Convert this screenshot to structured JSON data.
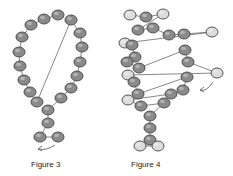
{
  "figures": [
    {
      "id": "figure-3",
      "caption": "Figure 3",
      "bead_color_dark": "#8a8a8a",
      "bead_color_light": "#c9c9c9",
      "stroke": "#444444",
      "beads": [
        [
          58,
          15,
          "d"
        ],
        [
          44,
          19,
          "d"
        ],
        [
          31,
          25,
          "d"
        ],
        [
          22,
          37,
          "d"
        ],
        [
          19,
          52,
          "d"
        ],
        [
          20,
          66,
          "d"
        ],
        [
          24,
          80,
          "d"
        ],
        [
          30,
          92,
          "d"
        ],
        [
          37,
          102,
          "d"
        ],
        [
          71,
          20,
          "d"
        ],
        [
          80,
          33,
          "d"
        ],
        [
          82,
          47,
          "d"
        ],
        [
          80,
          62,
          "d"
        ],
        [
          77,
          76,
          "d"
        ],
        [
          71,
          88,
          "d"
        ],
        [
          61,
          98,
          "d"
        ],
        [
          48,
          110,
          "d"
        ],
        [
          48,
          123,
          "d"
        ],
        [
          40,
          137,
          "d"
        ],
        [
          58,
          137,
          "d"
        ]
      ],
      "arrow": {
        "from": [
          55,
          145
        ],
        "to": [
          38,
          149
        ]
      }
    },
    {
      "id": "figure-4",
      "caption": "Figure 4",
      "bead_color_dark": "#8a8a8a",
      "bead_color_light": "#dcdcdc",
      "stroke": "#444444",
      "beads": [
        [
          20,
          15,
          "l"
        ],
        [
          36,
          17,
          "d"
        ],
        [
          53,
          14,
          "l"
        ],
        [
          28,
          30,
          "d"
        ],
        [
          43,
          28,
          "d"
        ],
        [
          59,
          35,
          "d"
        ],
        [
          74,
          34,
          "d"
        ],
        [
          102,
          32,
          "l"
        ],
        [
          15,
          43,
          "l"
        ],
        [
          22,
          45,
          "d"
        ],
        [
          25,
          57,
          "d"
        ],
        [
          17,
          62,
          "d"
        ],
        [
          29,
          68,
          "d"
        ],
        [
          75,
          50,
          "d"
        ],
        [
          78,
          62,
          "d"
        ],
        [
          107,
          73,
          "l"
        ],
        [
          18,
          75,
          "l"
        ],
        [
          24,
          82,
          "d"
        ],
        [
          28,
          94,
          "d"
        ],
        [
          77,
          77,
          "d"
        ],
        [
          73,
          90,
          "d"
        ],
        [
          61,
          94,
          "d"
        ],
        [
          18,
          100,
          "l"
        ],
        [
          31,
          106,
          "d"
        ],
        [
          54,
          103,
          "d"
        ],
        [
          40,
          116,
          "d"
        ],
        [
          40,
          128,
          "d"
        ],
        [
          40,
          140,
          "d"
        ],
        [
          30,
          146,
          "l"
        ],
        [
          48,
          146,
          "l"
        ]
      ],
      "arrow": {
        "from": [
          103,
          82
        ],
        "to": [
          90,
          90
        ]
      }
    }
  ]
}
